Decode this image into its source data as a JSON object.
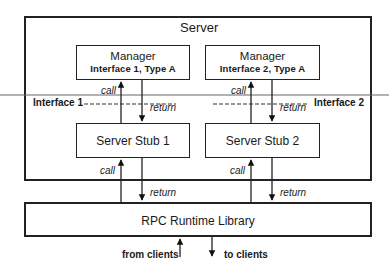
{
  "server": {
    "title": "Server"
  },
  "managers": [
    {
      "title": "Manager",
      "subtitle": "Interface 1, Type A"
    },
    {
      "title": "Manager",
      "subtitle": "Interface 2, Type A"
    }
  ],
  "interfaces": [
    {
      "label": "Interface 1"
    },
    {
      "label": "Interface 2"
    }
  ],
  "stubs": [
    {
      "label": "Server Stub 1"
    },
    {
      "label": "Server Stub 2"
    }
  ],
  "runtime": {
    "label": "RPC Runtime Library"
  },
  "arrows": {
    "call": "call",
    "return": "return"
  },
  "clients": {
    "from": "from clients",
    "to": "to clients"
  },
  "colors": {
    "stroke": "#222222",
    "divider": "#666666",
    "background": "#ffffff"
  }
}
